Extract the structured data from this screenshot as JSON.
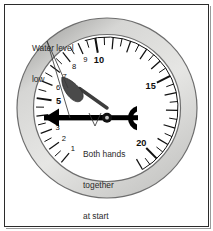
{
  "figure": {
    "kind": "pressure-gauge-illustration",
    "background": "#ffffff",
    "frame_color": "#2b2b2b"
  },
  "gauge": {
    "bezel_outer_color": "#6e6e6e",
    "bezel_fill_color": "#d2d2d0",
    "face_color": "#ffffff",
    "dial_ring_color": "#1a1a1a",
    "needle_color": "#3d3d3d",
    "pointer_color": "#000000",
    "hub_color": "#1a1a1a",
    "scale": {
      "min": 1,
      "max": 21,
      "major_labels": [
        "5",
        "10",
        "15",
        "20"
      ],
      "minor_labels": [
        "1",
        "2",
        "3",
        "4",
        "6",
        "7",
        "8",
        "9"
      ],
      "all_tick_values": [
        1,
        2,
        3,
        4,
        5,
        6,
        7,
        8,
        9,
        10,
        11,
        12,
        13,
        14,
        15,
        16,
        17,
        18,
        19,
        20,
        21
      ],
      "bold_label_values": [
        5,
        10,
        15,
        20
      ],
      "needle_value": 1,
      "pointer_value": 1
    }
  },
  "annotations": {
    "water_level": {
      "line1": "Water level",
      "line2": "low",
      "color": "#2a2a2a"
    },
    "both_hands": {
      "line1": "Both hands",
      "line2": "together",
      "line3": "at start",
      "line4": "of furnace",
      "line5": "operation",
      "color": "#2a2a2a"
    }
  },
  "chart_data": {
    "type": "table",
    "categories": [
      "1",
      "2",
      "3",
      "4",
      "5",
      "6",
      "7",
      "8",
      "9",
      "10",
      "15",
      "20"
    ],
    "values": [
      1,
      2,
      3,
      4,
      5,
      6,
      7,
      8,
      9,
      10,
      15,
      20
    ],
    "xlabel": "",
    "ylabel": "",
    "annotations": [
      "Water level low",
      "Both hands together at start of furnace operation"
    ]
  }
}
